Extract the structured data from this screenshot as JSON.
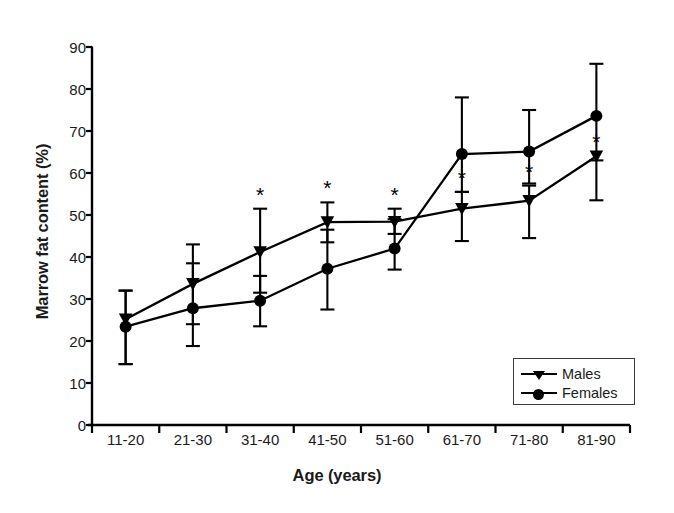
{
  "chart_data": {
    "type": "line",
    "title": "",
    "xlabel": "Age (years)",
    "ylabel": "Marrow fat content (%)",
    "categories": [
      "11-20",
      "21-30",
      "31-40",
      "41-50",
      "51-60",
      "61-70",
      "71-80",
      "81-90"
    ],
    "ylim": [
      0,
      90
    ],
    "yticks": [
      0,
      10,
      20,
      30,
      40,
      50,
      60,
      70,
      80,
      90
    ],
    "ytick_labels": [
      "0",
      "10",
      "20",
      "30",
      "40",
      "50",
      "60",
      "70",
      "80",
      "90"
    ],
    "grid": false,
    "legend_position": "lower right",
    "series": [
      {
        "name": "Males",
        "marker": "triangle-down",
        "values": [
          25.2,
          33.6,
          41.2,
          48.3,
          48.4,
          51.5,
          53.4,
          64.0
        ],
        "err_upper": [
          32.0,
          43.0,
          51.5,
          53.0,
          51.5,
          55.5,
          57.0,
          64.0
        ],
        "err_lower": [
          14.5,
          24.0,
          31.5,
          43.5,
          45.5,
          43.8,
          44.5,
          53.5
        ],
        "significance": [
          "",
          "",
          "*",
          "*",
          "*",
          "*",
          "*",
          "*"
        ]
      },
      {
        "name": "Females",
        "marker": "circle",
        "values": [
          23.4,
          27.8,
          29.6,
          37.2,
          42.0,
          64.5,
          65.1,
          73.6
        ],
        "err_upper": [
          32.0,
          38.5,
          35.5,
          46.5,
          49.0,
          78.0,
          75.0,
          86.0
        ],
        "err_lower": [
          14.5,
          18.8,
          23.5,
          27.5,
          37.0,
          55.5,
          57.5,
          63.0
        ],
        "significance": [
          "",
          "",
          "",
          "",
          "",
          "",
          "",
          ""
        ]
      }
    ],
    "annotations": {
      "asterisk_symbol": "*",
      "asterisk_note": "Asterisks mark significant differences at age groups 31-40 through 81-90"
    }
  },
  "legend": {
    "items": [
      {
        "label": "Males",
        "marker": "triangle-down-icon"
      },
      {
        "label": "Females",
        "marker": "circle-icon"
      }
    ]
  }
}
